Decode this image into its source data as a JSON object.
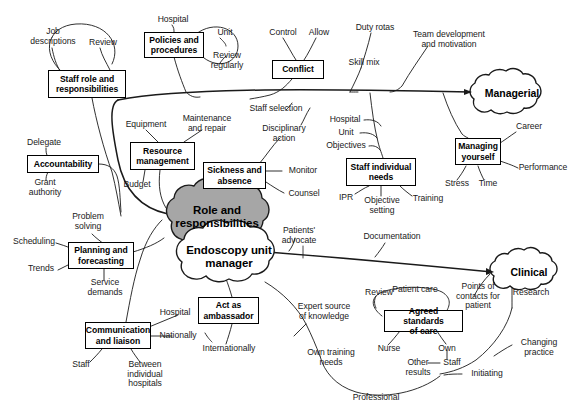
{
  "diagram": {
    "center": {
      "primary": "Role and\nresponsibilities",
      "secondary": "Endoscopy unit\nmanager",
      "primary_fill": "#a6a6a6",
      "secondary_fill": "#ffffff"
    },
    "branch_clouds": [
      {
        "id": "managerial",
        "label": "Managerial",
        "fill": "#ffffff"
      },
      {
        "id": "clinical",
        "label": "Clinical",
        "fill": "#ffffff"
      }
    ],
    "boxes": [
      {
        "id": "staff-role",
        "label": "Staff role and\nresponsibilities"
      },
      {
        "id": "policies",
        "label": "Policies and\nprocedures"
      },
      {
        "id": "conflict",
        "label": "Conflict"
      },
      {
        "id": "accountability",
        "label": "Accountability"
      },
      {
        "id": "resource-management",
        "label": "Resource\nmanagement"
      },
      {
        "id": "sickness-absence",
        "label": "Sickness and\nabsence"
      },
      {
        "id": "staff-individual-needs",
        "label": "Staff individual\nneeds"
      },
      {
        "id": "managing-yourself",
        "label": "Managing\nyourself"
      },
      {
        "id": "planning-forecasting",
        "label": "Planning and\nforecasting"
      },
      {
        "id": "act-as-ambassador",
        "label": "Act as\nambassador"
      },
      {
        "id": "communication-liaison",
        "label": "Communication\nand liaison"
      },
      {
        "id": "agreed-standards",
        "label": "Agreed standards\nof care"
      }
    ],
    "leaf_labels": [
      {
        "id": "job-descriptions",
        "text": "Job\ndescriptions"
      },
      {
        "id": "review-staff-role",
        "text": "Review"
      },
      {
        "id": "hospital-policies",
        "text": "Hospital"
      },
      {
        "id": "unit-policies",
        "text": "Unit"
      },
      {
        "id": "review-regularly",
        "text": "Review\nregularly"
      },
      {
        "id": "control",
        "text": "Control"
      },
      {
        "id": "allow",
        "text": "Allow"
      },
      {
        "id": "duty-rotas",
        "text": "Duty rotas"
      },
      {
        "id": "skill-mix",
        "text": "Skill mix"
      },
      {
        "id": "team-development",
        "text": "Team development\nand motivation"
      },
      {
        "id": "delegate",
        "text": "Delegate"
      },
      {
        "id": "grant-authority",
        "text": "Grant\nauthority"
      },
      {
        "id": "equipment",
        "text": "Equipment"
      },
      {
        "id": "maintenance-repair",
        "text": "Maintenance\nand repair"
      },
      {
        "id": "budget",
        "text": "Budget"
      },
      {
        "id": "staff-selection",
        "text": "Staff selection"
      },
      {
        "id": "disciplinary-action",
        "text": "Disciplinary\naction"
      },
      {
        "id": "monitor",
        "text": "Monitor"
      },
      {
        "id": "counsel",
        "text": "Counsel"
      },
      {
        "id": "hospital-needs",
        "text": "Hospital"
      },
      {
        "id": "unit-needs",
        "text": "Unit"
      },
      {
        "id": "objectives",
        "text": "Objectives"
      },
      {
        "id": "ipr",
        "text": "IPR"
      },
      {
        "id": "objective-setting",
        "text": "Objective\nsetting"
      },
      {
        "id": "training",
        "text": "Training"
      },
      {
        "id": "career",
        "text": "Career"
      },
      {
        "id": "performance",
        "text": "Performance"
      },
      {
        "id": "stress",
        "text": "Stress"
      },
      {
        "id": "time",
        "text": "Time"
      },
      {
        "id": "problem-solving",
        "text": "Problem\nsolving"
      },
      {
        "id": "scheduling",
        "text": "Scheduling"
      },
      {
        "id": "trends",
        "text": "Trends"
      },
      {
        "id": "service-demands",
        "text": "Service\ndemands"
      },
      {
        "id": "hospital-ambassador",
        "text": "Hospital"
      },
      {
        "id": "nationally",
        "text": "Nationally"
      },
      {
        "id": "internationally",
        "text": "Internationally"
      },
      {
        "id": "staff-comm",
        "text": "Staff"
      },
      {
        "id": "between-hospitals",
        "text": "Between\nindividual\nhospitals"
      },
      {
        "id": "patients-advocate",
        "text": "Patients'\nadvocate"
      },
      {
        "id": "documentation",
        "text": "Documentation"
      },
      {
        "id": "expert-source",
        "text": "Expert source\nof knowledge"
      },
      {
        "id": "own-training-needs",
        "text": "Own training\nneeds"
      },
      {
        "id": "professional",
        "text": "Professional"
      },
      {
        "id": "patient-care",
        "text": "Patient care"
      },
      {
        "id": "review-standards",
        "text": "Review"
      },
      {
        "id": "points-of-contacts",
        "text": "Points of\ncontacts for\npatient"
      },
      {
        "id": "research",
        "text": "Research"
      },
      {
        "id": "nurse",
        "text": "Nurse"
      },
      {
        "id": "own",
        "text": "Own"
      },
      {
        "id": "other-results",
        "text": "Other\nresults"
      },
      {
        "id": "staff-standards",
        "text": "Staff"
      },
      {
        "id": "changing-practice",
        "text": "Changing\npractice"
      },
      {
        "id": "initiating",
        "text": "Initiating"
      }
    ]
  }
}
